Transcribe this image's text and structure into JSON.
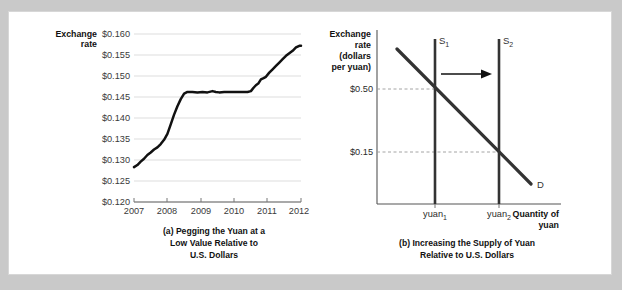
{
  "figure": {
    "background_color": "#c9c9c9",
    "panel_color": "#ffffff",
    "line_color": "#111111"
  },
  "chart_data": [
    {
      "id": "panel-a",
      "type": "line",
      "title": "",
      "caption_lines": [
        "(a) Pegging the Yuan at a",
        "Low Value Relative to",
        "U.S. Dollars"
      ],
      "ylabel_lines": [
        "Exchange",
        "rate"
      ],
      "xlabel": "",
      "ylim": [
        0.12,
        0.16
      ],
      "xlim": [
        2007,
        2012
      ],
      "grid": true,
      "legend": "none",
      "ytick_labels": [
        "$0.160",
        "$0.155",
        "$0.150",
        "$0.145",
        "$0.140",
        "$0.135",
        "$0.130",
        "$0.125",
        "$0.120"
      ],
      "ytick_values": [
        0.16,
        0.155,
        0.15,
        0.145,
        0.14,
        0.135,
        0.13,
        0.125,
        0.12
      ],
      "xtick_labels": [
        "2007",
        "2008",
        "2009",
        "2010",
        "2011",
        "2012"
      ],
      "xtick_values": [
        2007,
        2008,
        2009,
        2010,
        2011,
        2012
      ],
      "series": [
        {
          "name": "Exchange rate (dollars per yuan)",
          "x": [
            2007.0,
            2007.1,
            2007.2,
            2007.3,
            2007.4,
            2007.5,
            2007.6,
            2007.7,
            2007.8,
            2007.9,
            2008.0,
            2008.1,
            2008.2,
            2008.3,
            2008.4,
            2008.5,
            2008.6,
            2008.75,
            2008.9,
            2009.05,
            2009.2,
            2009.35,
            2009.45,
            2009.55,
            2009.7,
            2009.85,
            2010.0,
            2010.2,
            2010.4,
            2010.5,
            2010.58,
            2010.65,
            2010.72,
            2010.8,
            2010.88,
            2010.95,
            2011.05,
            2011.15,
            2011.25,
            2011.35,
            2011.45,
            2011.55,
            2011.65,
            2011.75,
            2011.85,
            2011.95,
            2012.0
          ],
          "y": [
            0.1283,
            0.1288,
            0.1296,
            0.1303,
            0.1312,
            0.1318,
            0.1325,
            0.133,
            0.1338,
            0.1348,
            0.1362,
            0.1385,
            0.1408,
            0.1428,
            0.1445,
            0.1458,
            0.1462,
            0.1462,
            0.1461,
            0.1462,
            0.1461,
            0.1464,
            0.1462,
            0.1461,
            0.1462,
            0.1462,
            0.1462,
            0.1462,
            0.1462,
            0.1464,
            0.1472,
            0.1478,
            0.1482,
            0.1492,
            0.1495,
            0.1498,
            0.1508,
            0.1516,
            0.1524,
            0.1532,
            0.154,
            0.1548,
            0.1554,
            0.156,
            0.1568,
            0.1572,
            0.1572
          ]
        }
      ]
    },
    {
      "id": "panel-b",
      "type": "line",
      "title": "",
      "caption_lines": [
        "(b) Increasing the Supply of Yuan",
        "Relative to U.S. Dollars"
      ],
      "ylabel_lines": [
        "Exchange",
        "rate",
        "(dollars",
        "per yuan)"
      ],
      "xlabel_lines": [
        "Quantity of",
        "yuan"
      ],
      "grid": false,
      "legend": "inline-curve-labels",
      "ytick_labels": [
        "$0.50",
        "$0.15"
      ],
      "ytick_values": [
        0.5,
        0.15
      ],
      "xtick_labels": [
        "yuan",
        "yuan"
      ],
      "xtick_subscripts": [
        "1",
        "2"
      ],
      "curves": [
        {
          "name": "S",
          "subscript": "1",
          "kind": "supply",
          "quantity": "yuan1",
          "note": "vertical supply curve before increase"
        },
        {
          "name": "S",
          "subscript": "2",
          "kind": "supply",
          "quantity": "yuan2",
          "note": "vertical supply curve after increase"
        },
        {
          "name": "D",
          "subscript": "",
          "kind": "demand",
          "note": "downward sloping demand curve"
        }
      ],
      "annotations": [
        {
          "name": "shift-arrow",
          "text": "",
          "direction": "right",
          "meaning": "supply shifts right from S1 to S2"
        }
      ],
      "equilibria": [
        {
          "price_label": "$0.50",
          "quantity_label": "yuan1"
        },
        {
          "price_label": "$0.15",
          "quantity_label": "yuan2"
        }
      ]
    }
  ]
}
